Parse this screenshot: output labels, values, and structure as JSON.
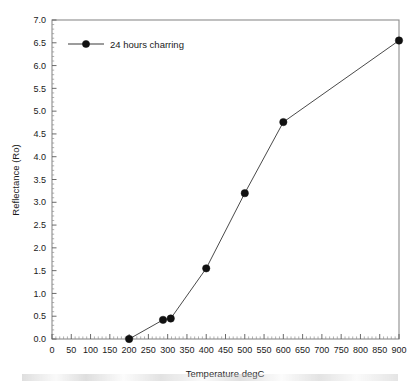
{
  "chart_data": {
    "type": "line",
    "title": "",
    "xlabel": "Temperature degC",
    "ylabel": "Reflectance (Ro)",
    "xlim": [
      0,
      900
    ],
    "ylim": [
      0.0,
      7.0
    ],
    "xticks": [
      0,
      50,
      100,
      150,
      200,
      250,
      300,
      350,
      400,
      450,
      500,
      550,
      600,
      650,
      700,
      750,
      800,
      850,
      900
    ],
    "xtick_labels": [
      "0",
      "50",
      "100",
      "150",
      "200",
      "250",
      "300",
      "350",
      "400",
      "450",
      "500",
      "550",
      "600",
      "650",
      "700",
      "750",
      "800",
      "850",
      "900"
    ],
    "yticks": [
      0.0,
      0.5,
      1.0,
      1.5,
      2.0,
      2.5,
      3.0,
      3.5,
      4.0,
      4.5,
      5.0,
      5.5,
      6.0,
      6.5,
      7.0
    ],
    "ytick_labels": [
      "0.0",
      "0.5",
      "1.0",
      "1.5",
      "2.0",
      "2.5",
      "3.0",
      "3.5",
      "4.0",
      "4.5",
      "5.0",
      "5.5",
      "6.0",
      "6.5",
      "7.0"
    ],
    "x_minor_step": 10,
    "y_minor_step": 0.1,
    "grid": false,
    "legend_position": "top-left",
    "series": [
      {
        "name": "24 hours charring",
        "marker": "filled-circle",
        "color": "#111111",
        "line_color": "#4a4a4a",
        "x": [
          200,
          288,
          308,
          400,
          500,
          600,
          900
        ],
        "values": [
          0.0,
          0.42,
          0.45,
          1.55,
          3.2,
          4.76,
          6.55
        ]
      }
    ]
  },
  "legend": {
    "entries": [
      {
        "label": "24 hours charring"
      }
    ]
  },
  "axes": {
    "x_title": "Temperature degC",
    "y_title": "Reflectance (Ro)"
  }
}
